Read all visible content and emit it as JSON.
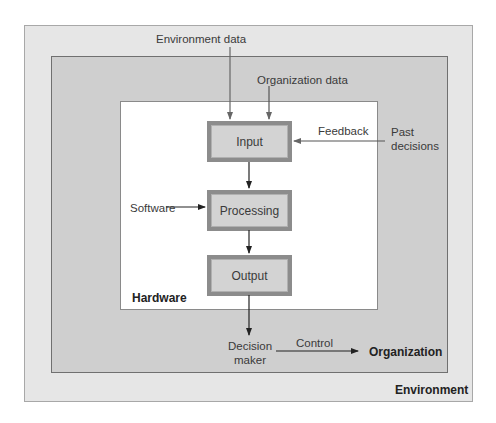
{
  "boxes": {
    "environment": "Environment",
    "organization": "Organization",
    "hardware": "Hardware"
  },
  "nodes": {
    "input": "Input",
    "processing": "Processing",
    "output": "Output"
  },
  "labels": {
    "environment_data": "Environment data",
    "organization_data": "Organization data",
    "feedback": "Feedback",
    "past_decisions_line1": "Past",
    "past_decisions_line2": "decisions",
    "software": "Software",
    "decision_maker_line1": "Decision",
    "decision_maker_line2": "maker",
    "control": "Control"
  },
  "colors": {
    "environment_fill": "#e6e6e6",
    "organization_fill": "#cfcfcf",
    "hardware_fill": "#ffffff",
    "node_fill": "#d3d3d3",
    "node_border": "#8c8c8c"
  }
}
